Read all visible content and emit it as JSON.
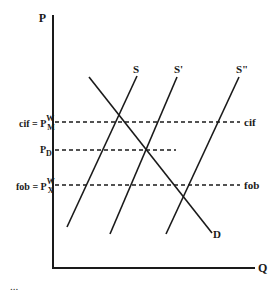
{
  "diagram": {
    "type": "supply-demand",
    "axes": {
      "y_label": "P",
      "x_label": "Q"
    },
    "price_levels": [
      {
        "id": "cif",
        "left_label_prefix": "cif = P",
        "sup": "W",
        "sub": "M",
        "right_label": "cif"
      },
      {
        "id": "pd",
        "left_label_prefix": "P",
        "sub": "D"
      },
      {
        "id": "fob",
        "left_label_prefix": "fob = P",
        "sup": "W",
        "sub": "X",
        "right_label": "fob"
      }
    ],
    "curves": [
      {
        "id": "S",
        "label": "S"
      },
      {
        "id": "S1",
        "label": "S'"
      },
      {
        "id": "S2",
        "label": "S\""
      },
      {
        "id": "D",
        "label": "D"
      }
    ],
    "caption": "..."
  },
  "colors": {
    "line": "#1a1a1a",
    "background": "#ffffff"
  }
}
